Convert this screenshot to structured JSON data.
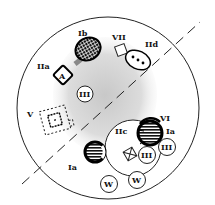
{
  "diagram": {
    "type": "cell-schematic",
    "labels": {
      "Ib": "Ib",
      "VII": "VII",
      "IIa": "IIa",
      "IId": "IId",
      "A": "A",
      "III_top": "III",
      "V": "V",
      "VI": "VI",
      "Ia_right": "Ia",
      "IIc": "IIc",
      "Ia_left": "Ia",
      "III_bottom1": "III",
      "III_bottom2": "III",
      "W1": "W",
      "W2": "W"
    },
    "colors": {
      "stroke": "#111111",
      "stipple": "#cfcfcf",
      "background": "#ffffff"
    }
  }
}
